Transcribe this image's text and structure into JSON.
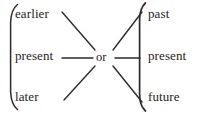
{
  "figure": {
    "name": "temporal-relation-diagram",
    "stroke_color": "#2b2b2b",
    "text_color": "#1d1d1d",
    "background_color": "#ffffff",
    "width": 206,
    "height": 114,
    "connector": {
      "label": "or",
      "icon": "disjunction-node"
    },
    "left_group": {
      "bracket_icon": "left-curly-brace-icon",
      "items": [
        {
          "label": "earlier",
          "row": "top"
        },
        {
          "label": "present",
          "row": "middle"
        },
        {
          "label": "later",
          "row": "bottom"
        }
      ]
    },
    "right_group": {
      "bracket_icon": "right-curly-brace-icon",
      "items": [
        {
          "label": "past",
          "row": "top"
        },
        {
          "label": "present",
          "row": "middle"
        },
        {
          "label": "future",
          "row": "bottom"
        }
      ]
    },
    "edges": [
      {
        "from": "earlier",
        "to": "or",
        "style": "diagonal"
      },
      {
        "from": "present-left",
        "to": "or",
        "style": "horizontal"
      },
      {
        "from": "later",
        "to": "or",
        "style": "diagonal"
      },
      {
        "from": "or",
        "to": "past",
        "style": "diagonal"
      },
      {
        "from": "or",
        "to": "present-right",
        "style": "horizontal"
      },
      {
        "from": "or",
        "to": "future",
        "style": "diagonal"
      }
    ]
  }
}
